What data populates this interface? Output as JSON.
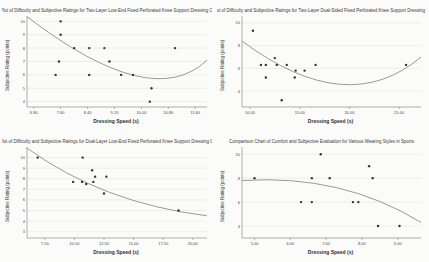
{
  "colors": {
    "background": "#f3f3f0",
    "panel": "#fbfbf9",
    "grid": "#dededa",
    "axis": "#8c8c8c",
    "tick_text": "#4a4a4a",
    "point": "#343434",
    "curve": "#8f8f8f"
  },
  "chart_data": [
    {
      "type": "scatter",
      "title": "Scatter Plot of Difficulty and Subjective Ratings for Two-Layer Low-End Fixed Perforated Knee Support Dressing Operation",
      "xlabel": "Dressing Speed (s)",
      "ylabel": "Subjective Rating (points)",
      "xlim": [
        6.6,
        11.95
      ],
      "ylim": [
        3.6,
        10.4
      ],
      "x_ticks": [
        6.8,
        7.6,
        8.4,
        9.2,
        10.0,
        10.8,
        11.6
      ],
      "x_tick_labels": [
        "6.80",
        "7.60",
        "8.40",
        "9.20",
        "10.00",
        "10.80",
        "11.60"
      ],
      "y_ticks": [
        4,
        5,
        6,
        7,
        8,
        9,
        10
      ],
      "grid": "horizontal",
      "legend": "none",
      "points": [
        [
          7.6,
          10
        ],
        [
          7.6,
          9
        ],
        [
          8.0,
          8
        ],
        [
          8.45,
          8
        ],
        [
          8.9,
          8
        ],
        [
          11.0,
          8
        ],
        [
          7.55,
          7
        ],
        [
          9.05,
          7
        ],
        [
          7.45,
          6
        ],
        [
          8.45,
          6
        ],
        [
          9.4,
          6
        ],
        [
          9.75,
          6
        ],
        [
          10.3,
          5
        ],
        [
          10.25,
          4
        ]
      ],
      "trend": {
        "type": "quadratic-fit",
        "anchors": [
          [
            6.6,
            10.35
          ],
          [
            9.8,
            5.95
          ],
          [
            11.95,
            7.1
          ]
        ]
      }
    },
    {
      "type": "scatter",
      "title": "Scatter Plot of Difficulty and Subjective Ratings for Two-Layer Dual-Sided Fixed Perforated Knee Support Dressing Operation",
      "xlabel": "Dressing Speed (s)",
      "ylabel": "Subjective Rating (points)",
      "xlim": [
        9.2,
        27.2
      ],
      "ylim": [
        2.6,
        10.6
      ],
      "x_ticks": [
        10,
        15,
        20,
        25
      ],
      "x_tick_labels": [
        "10.00",
        "15.00",
        "20.00",
        "25.00"
      ],
      "y_ticks": [
        4,
        6,
        8,
        10
      ],
      "grid": "horizontal",
      "legend": "none",
      "points": [
        [
          10.3,
          9.3
        ],
        [
          11.1,
          6.3
        ],
        [
          11.6,
          6.3
        ],
        [
          12.5,
          6.9
        ],
        [
          12.7,
          6.3
        ],
        [
          11.6,
          5.2
        ],
        [
          13.7,
          6.3
        ],
        [
          14.6,
          5.8
        ],
        [
          14.5,
          5.2
        ],
        [
          15.5,
          5.8
        ],
        [
          16.6,
          6.3
        ],
        [
          13.2,
          3.2
        ],
        [
          25.7,
          6.3
        ]
      ],
      "trend": {
        "type": "quadratic-fit",
        "anchors": [
          [
            9.2,
            8.4
          ],
          [
            19.0,
            4.6
          ],
          [
            27.2,
            7.0
          ]
        ]
      }
    },
    {
      "type": "scatter",
      "title": "Scatter Plot of Difficulty and Subjective Ratings for Dual-Layer Low-End Fixed Perforated Knee Support Dressing Operation",
      "xlabel": "Dressing Speed (s)",
      "ylabel": "Subjective Rating (points)",
      "xlim": [
        6.0,
        21.2
      ],
      "ylim": [
        2.4,
        11.0
      ],
      "x_ticks": [
        7.5,
        10,
        12.5,
        15,
        17.5,
        20
      ],
      "x_tick_labels": [
        "7.50",
        "10.00",
        "12.50",
        "15.00",
        "17.50",
        "20.00"
      ],
      "y_ticks": [
        3,
        4,
        5,
        6,
        7,
        8,
        9,
        10
      ],
      "grid": "horizontal",
      "legend": "none",
      "points": [
        [
          6.9,
          10
        ],
        [
          10.7,
          10
        ],
        [
          11.5,
          8.8
        ],
        [
          9.9,
          7.7
        ],
        [
          10.65,
          7.7
        ],
        [
          11.0,
          7.5
        ],
        [
          11.6,
          7.7
        ],
        [
          11.75,
          8.2
        ],
        [
          12.7,
          8.2
        ],
        [
          12.5,
          6.6
        ],
        [
          18.8,
          5.0
        ]
      ],
      "trend": {
        "type": "quadratic-fit",
        "anchors": [
          [
            6.0,
            10.9
          ],
          [
            13.0,
            6.7
          ],
          [
            21.2,
            4.5
          ]
        ]
      }
    },
    {
      "type": "scatter",
      "title": "Comparison Chart of Comfort and Subjective Evaluation for Various Wearing Styles in Sports",
      "xlabel": "Dressing Speed (s)",
      "ylabel": "Subjective Rating (points)",
      "xlim": [
        4.65,
        9.65
      ],
      "ylim": [
        3.0,
        10.6
      ],
      "x_ticks": [
        5,
        6,
        7,
        8,
        9
      ],
      "x_tick_labels": [
        "5.00",
        "6.00",
        "7.00",
        "8.00",
        "9.00"
      ],
      "y_ticks": [
        4,
        6,
        8,
        10
      ],
      "grid": "horizontal",
      "legend": "none",
      "points": [
        [
          5.0,
          8
        ],
        [
          6.6,
          8
        ],
        [
          6.85,
          10
        ],
        [
          7.1,
          8
        ],
        [
          8.2,
          9
        ],
        [
          8.3,
          8
        ],
        [
          6.3,
          6
        ],
        [
          6.6,
          6
        ],
        [
          7.75,
          6
        ],
        [
          7.9,
          6
        ],
        [
          8.45,
          4
        ],
        [
          9.05,
          4
        ]
      ],
      "trend": {
        "type": "quadratic-fit",
        "anchors": [
          [
            4.65,
            7.8
          ],
          [
            7.3,
            7.2
          ],
          [
            9.65,
            4.3
          ]
        ]
      }
    }
  ]
}
